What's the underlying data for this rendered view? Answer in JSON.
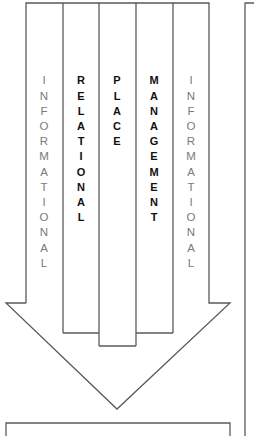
{
  "diagram": {
    "type": "downward-arrow-with-columns",
    "colors": {
      "line": "#5a5a5a",
      "light_text": "#7a7a7a",
      "bold_text": "#111111",
      "background": "#ffffff"
    },
    "columns": [
      {
        "id": "informational-left",
        "label": "INFORMATIONAL",
        "style": "light"
      },
      {
        "id": "relational",
        "label": "RELATIONAL",
        "style": "bold"
      },
      {
        "id": "place",
        "label": "PLACE",
        "style": "bold"
      },
      {
        "id": "management",
        "label": "MANAGEMENT",
        "style": "bold"
      },
      {
        "id": "informational-right",
        "label": "INFORMATIONAL",
        "style": "light"
      }
    ],
    "bottom_box": {
      "label": ""
    },
    "right_panel": {
      "label": ""
    }
  }
}
